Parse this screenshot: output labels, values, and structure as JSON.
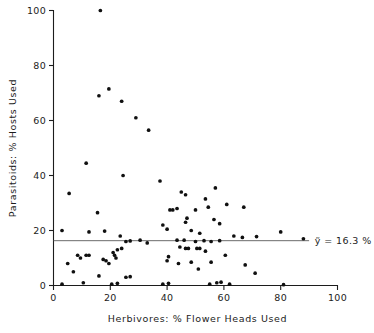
{
  "chart_data": {
    "type": "scatter",
    "title": "",
    "xlabel": "Herbivores:  %  Flower Heads Used",
    "ylabel": "Parasitoids:  % Hosts Used",
    "xlim": [
      0,
      100
    ],
    "ylim": [
      0,
      100
    ],
    "xticks": [
      0,
      20,
      40,
      60,
      80,
      100
    ],
    "yticks": [
      0,
      20,
      40,
      60,
      80,
      100
    ],
    "xtick_labels": [
      "0",
      "20",
      "40",
      "60",
      "80",
      "100"
    ],
    "ytick_labels": [
      "0",
      "20",
      "40",
      "60",
      "80",
      "100"
    ],
    "grid": false,
    "legend": false,
    "marker": "filled-circle",
    "marker_color": "#101010",
    "annotations": [
      {
        "name": "mean-label",
        "text": "ỹ = 16.3 %",
        "x": 92,
        "y": 16.3
      }
    ],
    "reference_lines": [
      {
        "name": "mean-line",
        "orientation": "horizontal",
        "value": 16.3,
        "x_start": 0,
        "x_end": 90,
        "color": "#5a5a5a",
        "label": "ỹ = 16.3 %"
      }
    ],
    "points": [
      [
        16.5,
        100.0
      ],
      [
        16.0,
        69.0
      ],
      [
        19.5,
        71.5
      ],
      [
        24.0,
        67.0
      ],
      [
        29.0,
        61.0
      ],
      [
        33.5,
        56.5
      ],
      [
        11.5,
        44.5
      ],
      [
        24.5,
        40.0
      ],
      [
        37.5,
        38.0
      ],
      [
        5.5,
        33.5
      ],
      [
        45.0,
        34.0
      ],
      [
        46.5,
        33.0
      ],
      [
        57.0,
        35.5
      ],
      [
        53.5,
        31.5
      ],
      [
        43.5,
        28.0
      ],
      [
        50.0,
        27.5
      ],
      [
        15.5,
        26.5
      ],
      [
        41.0,
        27.5
      ],
      [
        42.0,
        27.5
      ],
      [
        54.5,
        28.5
      ],
      [
        61.0,
        29.5
      ],
      [
        67.0,
        28.5
      ],
      [
        47.0,
        24.5
      ],
      [
        46.5,
        23.0
      ],
      [
        56.5,
        24.0
      ],
      [
        58.5,
        22.5
      ],
      [
        3.0,
        20.0
      ],
      [
        12.5,
        19.5
      ],
      [
        18.0,
        19.8
      ],
      [
        23.5,
        18.0
      ],
      [
        38.5,
        22.0
      ],
      [
        40.0,
        20.5
      ],
      [
        48.5,
        20.0
      ],
      [
        51.5,
        19.0
      ],
      [
        63.5,
        18.0
      ],
      [
        46.0,
        16.5
      ],
      [
        25.5,
        16.0
      ],
      [
        27.0,
        16.2
      ],
      [
        30.5,
        16.5
      ],
      [
        33.0,
        15.5
      ],
      [
        43.5,
        16.5
      ],
      [
        50.0,
        16.0
      ],
      [
        55.5,
        16.0
      ],
      [
        66.5,
        17.5
      ],
      [
        71.5,
        17.8
      ],
      [
        80.0,
        19.5
      ],
      [
        88.0,
        17.0
      ],
      [
        53.0,
        16.3
      ],
      [
        58.5,
        16.3
      ],
      [
        8.5,
        11.0
      ],
      [
        9.5,
        10.0
      ],
      [
        11.5,
        11.0
      ],
      [
        12.5,
        11.0
      ],
      [
        17.5,
        9.5
      ],
      [
        18.5,
        9.0
      ],
      [
        21.0,
        12.0
      ],
      [
        21.5,
        11.0
      ],
      [
        22.0,
        10.0
      ],
      [
        19.5,
        8.0
      ],
      [
        22.5,
        13.0
      ],
      [
        24.0,
        13.5
      ],
      [
        40.0,
        9.0
      ],
      [
        40.5,
        10.5
      ],
      [
        44.5,
        14.0
      ],
      [
        46.5,
        13.5
      ],
      [
        47.5,
        13.5
      ],
      [
        50.5,
        13.5
      ],
      [
        51.5,
        13.5
      ],
      [
        53.5,
        12.5
      ],
      [
        60.5,
        11.0
      ],
      [
        5.0,
        8.0
      ],
      [
        7.0,
        5.0
      ],
      [
        16.0,
        3.5
      ],
      [
        25.5,
        3.0
      ],
      [
        27.0,
        3.2
      ],
      [
        44.0,
        8.0
      ],
      [
        48.5,
        8.5
      ],
      [
        51.0,
        6.0
      ],
      [
        55.5,
        8.5
      ],
      [
        67.5,
        7.5
      ],
      [
        71.0,
        4.5
      ],
      [
        3.0,
        0.5
      ],
      [
        10.5,
        1.0
      ],
      [
        20.5,
        0.5
      ],
      [
        22.5,
        0.8
      ],
      [
        38.5,
        0.5
      ],
      [
        40.5,
        0.8
      ],
      [
        55.0,
        0.5
      ],
      [
        57.5,
        1.0
      ],
      [
        59.0,
        1.2
      ],
      [
        62.0,
        0.5
      ],
      [
        81.0,
        0.3
      ]
    ]
  }
}
